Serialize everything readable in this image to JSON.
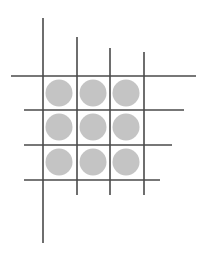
{
  "colors": {
    "background": "#ffffff",
    "line": "#4a4a4a",
    "circle": "#c4c4c4"
  },
  "grid": {
    "vertical_lines": [
      {
        "x": 43,
        "y1": 18,
        "y2": 243
      },
      {
        "x": 77,
        "y1": 37,
        "y2": 195
      },
      {
        "x": 110,
        "y1": 48,
        "y2": 195
      },
      {
        "x": 144,
        "y1": 52,
        "y2": 195
      }
    ],
    "horizontal_lines": [
      {
        "y": 76,
        "x1": 11,
        "x2": 196
      },
      {
        "y": 110,
        "x1": 24,
        "x2": 184
      },
      {
        "y": 145,
        "x1": 24,
        "x2": 172
      },
      {
        "y": 180,
        "x1": 24,
        "x2": 160
      }
    ],
    "circles": [
      {
        "cx": 59,
        "cy": 93,
        "r": 13.5
      },
      {
        "cx": 93,
        "cy": 93,
        "r": 13.5
      },
      {
        "cx": 126,
        "cy": 93,
        "r": 13.5
      },
      {
        "cx": 59,
        "cy": 127,
        "r": 13.5
      },
      {
        "cx": 93,
        "cy": 127,
        "r": 13.5
      },
      {
        "cx": 126,
        "cy": 127,
        "r": 13.5
      },
      {
        "cx": 59,
        "cy": 162,
        "r": 13.5
      },
      {
        "cx": 93,
        "cy": 162,
        "r": 13.5
      },
      {
        "cx": 126,
        "cy": 162,
        "r": 13.5
      }
    ]
  }
}
